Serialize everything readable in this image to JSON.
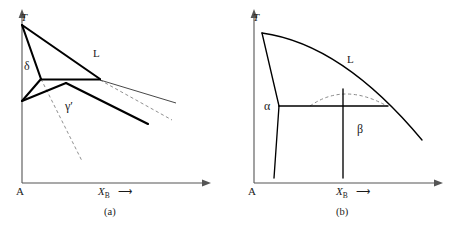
{
  "figure": {
    "type": "phase-diagram-pair",
    "panels": [
      {
        "id": "a",
        "caption": "(a)",
        "axis": {
          "y_label": "T",
          "x_label": "X",
          "x_label_sub": "B",
          "x_arrow": "⟶",
          "origin_label": "A"
        },
        "region_labels": [
          {
            "name": "liquid",
            "text": "L"
          },
          {
            "name": "delta",
            "text": "δ"
          },
          {
            "name": "gamma-prime",
            "text": "γ′"
          }
        ]
      },
      {
        "id": "b",
        "caption": "(b)",
        "axis": {
          "y_label": "T",
          "x_label": "X",
          "x_label_sub": "B",
          "x_arrow": "⟶",
          "origin_label": "A"
        },
        "region_labels": [
          {
            "name": "liquid",
            "text": "L"
          },
          {
            "name": "alpha",
            "text": "α"
          },
          {
            "name": "beta",
            "text": "β"
          }
        ]
      }
    ],
    "colors": {
      "ink": "#000000",
      "axis": "#4a4a4a",
      "thin": "#3a3a3a",
      "dashed": "#7a7a7a",
      "background": "#ffffff"
    }
  }
}
